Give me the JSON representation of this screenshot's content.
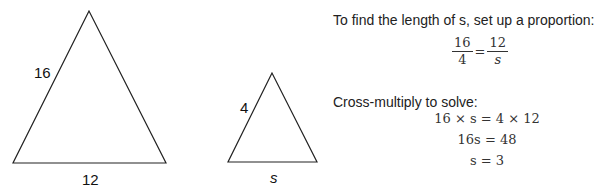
{
  "figure": {
    "large_triangle": {
      "side_label": "16",
      "base_label": "12"
    },
    "small_triangle": {
      "side_label": "4",
      "base_label": "s"
    }
  },
  "solution": {
    "intro_text": "To find the length of s, set up a proportion:",
    "proportion": {
      "left_num": "16",
      "left_den": "4",
      "equals": "=",
      "right_num": "12",
      "right_den": "s"
    },
    "cross_multiply_text": "Cross-multiply to solve:",
    "steps": [
      "16 × s = 4 × 12",
      "16s = 48",
      "s = 3"
    ]
  }
}
